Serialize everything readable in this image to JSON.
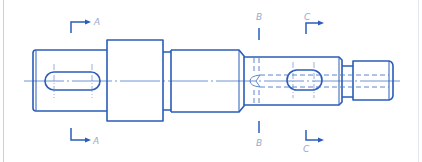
{
  "drawing": {
    "title": "Shaft drawing with section markers",
    "colors": {
      "line": "#2a5cb8",
      "thin": "#4a78c8",
      "label": "#9aa9c9",
      "border": "#c8d0e0",
      "background": "#ffffff"
    },
    "sections": [
      {
        "id": "A",
        "top_label": "A",
        "bottom_label": "A"
      },
      {
        "id": "B",
        "top_label": "B",
        "bottom_label": "B"
      },
      {
        "id": "C",
        "top_label": "C",
        "bottom_label": "C"
      }
    ]
  }
}
